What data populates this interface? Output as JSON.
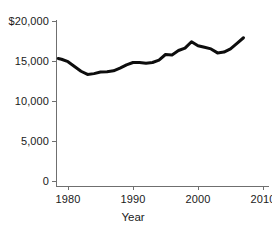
{
  "chart_data": {
    "type": "line",
    "title": "",
    "subtitle": "",
    "xlabel": "Year",
    "ylabel": "",
    "xlim": [
      1978,
      2011
    ],
    "ylim": [
      0,
      20000
    ],
    "grid": false,
    "legend": null,
    "xticks": [
      "1980",
      "1990",
      "2000",
      "2010"
    ],
    "xtick_values": [
      1980,
      1990,
      2000,
      2010
    ],
    "yticks": [
      "0",
      "5,000",
      "10,000",
      "15,000",
      "$20,000"
    ],
    "ytick_values": [
      0,
      5000,
      10000,
      15000,
      20000
    ],
    "line_color": "#0d0d0d",
    "line_width": 3,
    "axis_color": "#6f6f6f",
    "series": [
      {
        "name": "value",
        "x": [
          1978.5,
          1979,
          1980,
          1981,
          1982,
          1983,
          1984,
          1985,
          1986,
          1987,
          1988,
          1989,
          1990,
          1991,
          1992,
          1993,
          1994,
          1995,
          1996,
          1997,
          1998,
          1999,
          2000,
          2001,
          2002,
          2003,
          2004,
          2005,
          2006,
          2007
        ],
        "values": [
          15300,
          15200,
          14900,
          14300,
          13700,
          13300,
          13400,
          13600,
          13650,
          13750,
          14100,
          14500,
          14800,
          14800,
          14700,
          14800,
          15100,
          15800,
          15750,
          16300,
          16600,
          17400,
          16900,
          16700,
          16500,
          16000,
          16100,
          16500,
          17200,
          17900
        ]
      }
    ]
  },
  "axis_titles": {
    "x": "Year"
  }
}
